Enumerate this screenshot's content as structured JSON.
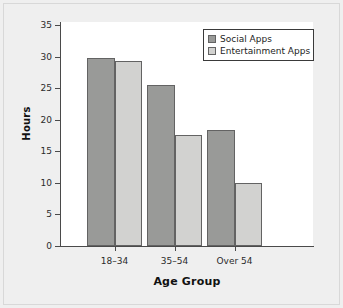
{
  "chart_data": {
    "type": "bar",
    "title": "",
    "xlabel": "Age Group",
    "ylabel": "Hours",
    "categories": [
      "18–34",
      "35–54",
      "Over 54"
    ],
    "series": [
      {
        "name": "Social Apps",
        "color": "#999a98",
        "values": [
          29.8,
          25.5,
          18.3
        ]
      },
      {
        "name": "Entertainment Apps",
        "color": "#d2d2d0",
        "values": [
          29.3,
          17.6,
          10.0
        ]
      }
    ],
    "ylim": [
      0,
      35
    ],
    "yticks": [
      0,
      5,
      10,
      15,
      20,
      25,
      30,
      35
    ],
    "ytick_labels": [
      "0",
      "5",
      "10",
      "15",
      "20",
      "25",
      "30",
      "35"
    ],
    "grid": false,
    "legend_position": "top-right",
    "legend_entries": [
      "Social Apps",
      "Entertainment Apps"
    ],
    "bar_border_color": "#636363",
    "plot_background": "#ffffff",
    "figure_background": "#efefef"
  }
}
